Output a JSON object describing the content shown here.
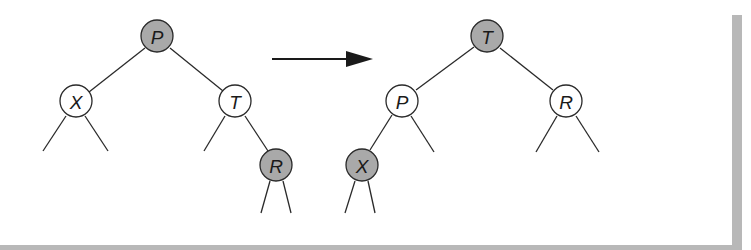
{
  "diagram": {
    "type": "tree-rotation",
    "colors": {
      "shaded_node": "#a9a9a9",
      "white_node": "#ffffff",
      "stroke": "#2a2a2a",
      "frame_shadow": "#b8b8b8"
    },
    "before": {
      "nodes": [
        {
          "id": "P",
          "label": "P",
          "shaded": true
        },
        {
          "id": "X",
          "label": "X",
          "shaded": false
        },
        {
          "id": "T",
          "label": "T",
          "shaded": false
        },
        {
          "id": "R",
          "label": "R",
          "shaded": true
        }
      ],
      "edges": [
        [
          "P",
          "X"
        ],
        [
          "P",
          "T"
        ],
        [
          "T",
          "R"
        ]
      ]
    },
    "arrow": {
      "direction": "right"
    },
    "after": {
      "nodes": [
        {
          "id": "T",
          "label": "T",
          "shaded": true
        },
        {
          "id": "P",
          "label": "P",
          "shaded": false
        },
        {
          "id": "R",
          "label": "R",
          "shaded": false
        },
        {
          "id": "X",
          "label": "X",
          "shaded": true
        }
      ],
      "edges": [
        [
          "T",
          "P"
        ],
        [
          "T",
          "R"
        ],
        [
          "P",
          "X"
        ]
      ]
    }
  }
}
